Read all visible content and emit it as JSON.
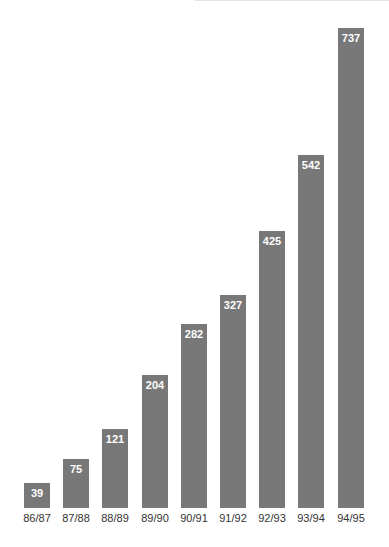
{
  "chart_data": {
    "type": "bar",
    "title": "",
    "xlabel": "",
    "ylabel": "",
    "categories": [
      "86/87",
      "87/88",
      "88/89",
      "89/90",
      "90/91",
      "91/92",
      "92/93",
      "93/94",
      "94/95"
    ],
    "values": [
      39,
      75,
      121,
      204,
      282,
      327,
      425,
      542,
      737
    ],
    "data_labels": [
      "39",
      "75",
      "121",
      "204",
      "282",
      "327",
      "425",
      "542",
      "737"
    ],
    "ylim": [
      0,
      737
    ],
    "grid": false,
    "legend": null,
    "bar_color": "#787878",
    "label_color": "#ffffff"
  }
}
